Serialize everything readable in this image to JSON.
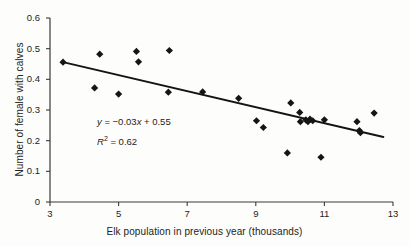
{
  "chart_data": {
    "type": "scatter",
    "title": "",
    "xlabel": "Elk population in previous year (thousands)",
    "ylabel": "Number of female with calves",
    "xlim": [
      3,
      13
    ],
    "ylim": [
      0,
      0.6
    ],
    "xticks": [
      "3",
      "5",
      "7",
      "9",
      "11",
      "13"
    ],
    "xtick_values": [
      3,
      5,
      7,
      9,
      11,
      13
    ],
    "yticks": [
      "0",
      "0.1",
      "0.2",
      "0.3",
      "0.4",
      "0.5",
      "0.6"
    ],
    "ytick_values": [
      0,
      0.1,
      0.2,
      0.3,
      0.4,
      0.5,
      0.6
    ],
    "grid": false,
    "legend": "none",
    "marker": "diamond",
    "marker_color": "#151515",
    "points": [
      {
        "x": 3.38,
        "y": 0.456
      },
      {
        "x": 4.45,
        "y": 0.482
      },
      {
        "x": 4.3,
        "y": 0.372
      },
      {
        "x": 5.0,
        "y": 0.352
      },
      {
        "x": 5.52,
        "y": 0.491
      },
      {
        "x": 5.58,
        "y": 0.457
      },
      {
        "x": 6.48,
        "y": 0.494
      },
      {
        "x": 6.45,
        "y": 0.358
      },
      {
        "x": 7.45,
        "y": 0.359
      },
      {
        "x": 8.5,
        "y": 0.338
      },
      {
        "x": 9.02,
        "y": 0.265
      },
      {
        "x": 9.22,
        "y": 0.243
      },
      {
        "x": 9.92,
        "y": 0.16
      },
      {
        "x": 10.02,
        "y": 0.323
      },
      {
        "x": 10.28,
        "y": 0.292
      },
      {
        "x": 10.3,
        "y": 0.262
      },
      {
        "x": 10.46,
        "y": 0.268
      },
      {
        "x": 10.52,
        "y": 0.262
      },
      {
        "x": 10.58,
        "y": 0.27
      },
      {
        "x": 10.66,
        "y": 0.265
      },
      {
        "x": 10.9,
        "y": 0.146
      },
      {
        "x": 11.0,
        "y": 0.268
      },
      {
        "x": 11.95,
        "y": 0.262
      },
      {
        "x": 12.02,
        "y": 0.233
      },
      {
        "x": 12.05,
        "y": 0.226
      },
      {
        "x": 12.45,
        "y": 0.29
      }
    ],
    "trendline": {
      "slope": -0.03,
      "intercept": 0.55,
      "x_start": 3.38,
      "x_end": 12.72,
      "y_start": 0.456,
      "y_end": 0.212,
      "color": "#141414"
    },
    "annotations": {
      "equation_y": "y",
      "equation_body": " = −0.03",
      "equation_x": "x",
      "equation_tail": " + 0.55",
      "r2_symbol": "R",
      "r2_exp": "2",
      "r2_value": " = 0.62"
    }
  },
  "colors": {
    "background": "#fdfdfb",
    "ink": "#1c1c1c",
    "axis": "#3a3a3a",
    "marker": "#151515"
  }
}
